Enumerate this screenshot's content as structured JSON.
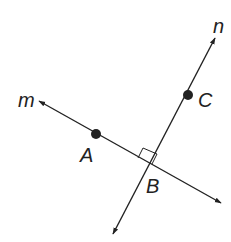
{
  "diagram": {
    "type": "geometry-perpendicular-lines",
    "colors": {
      "line": "#222222",
      "background": "#ffffff"
    },
    "lines": [
      {
        "name": "m",
        "label": "m",
        "from": [
          39,
          101
        ],
        "to": [
          221,
          203
        ]
      },
      {
        "name": "n",
        "label": "n",
        "from": [
          113,
          234
        ],
        "to": [
          215,
          38
        ]
      }
    ],
    "points": [
      {
        "name": "A",
        "label": "A",
        "x": 96,
        "y": 134,
        "dot": true
      },
      {
        "name": "B",
        "label": "B",
        "x": 151,
        "y": 165,
        "dot": false
      },
      {
        "name": "C",
        "label": "C",
        "x": 188,
        "y": 95,
        "dot": true
      }
    ],
    "right_angle_at": "B",
    "labels": {
      "m": "m",
      "n": "n",
      "A": "A",
      "B": "B",
      "C": "C"
    }
  }
}
